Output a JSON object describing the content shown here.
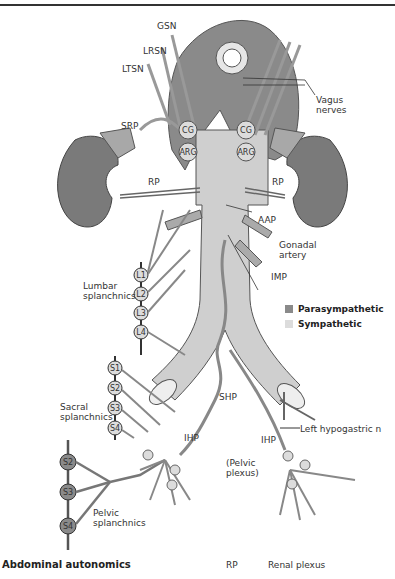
{
  "title": "Abdominal autonomics",
  "abbreviation": {
    "abbr": "RP",
    "definition": "Renal plexus"
  },
  "legend": [
    {
      "label": "Parasympathetic",
      "color": "#8a8a8a"
    },
    {
      "label": "Sympathetic",
      "color": "#dcdcdc"
    }
  ],
  "labels": {
    "gsn": "GSN",
    "lrsn": "LRSN",
    "ltsn": "LTSN",
    "srp": "SRP",
    "rp_left": "RP",
    "rp_right": "RP",
    "vagus": "Vagus nerves",
    "aap": "AAP",
    "gonadal": "Gonadal artery",
    "imp": "IMP",
    "lumbar": "Lumbar splanchnics",
    "sacral": "Sacral splanchnics",
    "shp": "SHP",
    "left_hypogastric": "Left hypogastric n",
    "ihp_left": "IHP",
    "ihp_right": "IHP",
    "pelvic_plexus": "(Pelvic plexus)",
    "pelvic_splanchnics": "Pelvic splanchnics"
  },
  "ganglia": {
    "cg_left": "CG",
    "cg_right": "CG",
    "arg_left": "ARG",
    "arg_right": "ARG"
  },
  "lumbar_ganglia": [
    "L1",
    "L2",
    "L3",
    "L4"
  ],
  "sacral_ganglia": [
    "S1",
    "S2",
    "S3",
    "S4"
  ],
  "pelvic_ganglia": [
    "S2",
    "S3",
    "S4"
  ],
  "colors": {
    "parasympathetic": "#8a8a8a",
    "sympathetic": "#dcdcdc",
    "kidney": "#7a7a7a",
    "aorta": "#cfcfcf",
    "outline": "#555555"
  }
}
